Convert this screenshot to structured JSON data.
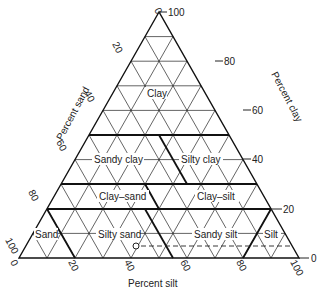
{
  "diagram": {
    "type": "ternary",
    "axes": {
      "sand": {
        "label": "Percent sand",
        "ticks": [
          "0",
          "20",
          "40",
          "60",
          "80",
          "100"
        ]
      },
      "clay": {
        "label": "Percent clay",
        "ticks": [
          "100",
          "80",
          "60",
          "40",
          "20",
          "0"
        ]
      },
      "silt": {
        "label": "Percent silt",
        "ticks": [
          "0",
          "20",
          "40",
          "60",
          "80",
          "100"
        ]
      }
    },
    "regions": [
      {
        "name": "Clay",
        "label": "Clay"
      },
      {
        "name": "Sandy clay",
        "label": "Sandy clay"
      },
      {
        "name": "Silty clay",
        "label": "Silty clay"
      },
      {
        "name": "Clay-sand",
        "label": "Clay–sand"
      },
      {
        "name": "Clay-silt",
        "label": "Clay–silt"
      },
      {
        "name": "Sand",
        "label": "Sand"
      },
      {
        "name": "Silty sand",
        "label": "Silty sand"
      },
      {
        "name": "Sandy silt",
        "label": "Sandy silt"
      },
      {
        "name": "Silt",
        "label": "Silt"
      }
    ],
    "grid_step_percent": 10,
    "colors": {
      "line": "#222222",
      "background": "#ffffff"
    }
  }
}
